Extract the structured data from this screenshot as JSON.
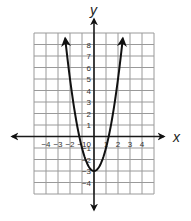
{
  "chart_data": {
    "type": "line",
    "title": "",
    "xlabel": "x",
    "ylabel": "y",
    "xlim": [
      -5,
      5
    ],
    "ylim": [
      -5,
      9
    ],
    "grid": true,
    "x_ticks": [
      -4,
      -3,
      -2,
      -1,
      1,
      2,
      3,
      4
    ],
    "y_ticks": [
      -4,
      -3,
      -2,
      -1,
      1,
      2,
      3,
      4,
      5,
      6,
      7,
      8
    ],
    "origin_label": "0",
    "series": [
      {
        "name": "parabola",
        "equation": "y = 2x^2 - 3",
        "vertex": [
          0,
          -3
        ],
        "x_intercepts": [
          -1.22,
          1.22
        ],
        "x": [
          -2.4,
          -2,
          -1.5,
          -1.22,
          -1,
          -0.5,
          0,
          0.5,
          1,
          1.22,
          1.5,
          2,
          2.4
        ],
        "values": [
          8.52,
          5,
          1.5,
          0,
          -1,
          -2.5,
          -3,
          -2.5,
          -1,
          0,
          1.5,
          5,
          8.52
        ],
        "arrows_at_ends": true
      }
    ]
  },
  "axes": {
    "x_label": "x",
    "y_label": "y"
  },
  "colors": {
    "grid": "#9a9a9a",
    "axis": "#1a1a1a",
    "curve": "#111111"
  }
}
